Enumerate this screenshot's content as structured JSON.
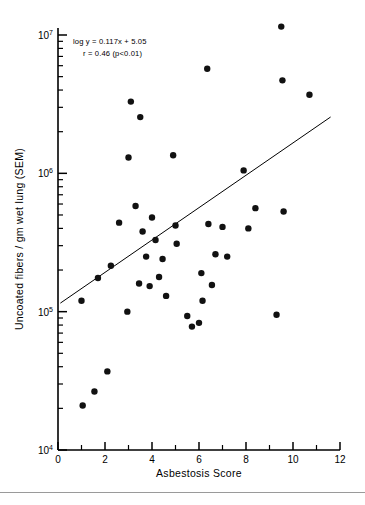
{
  "figure": {
    "title": "",
    "annotation_line1": "log y = 0.117x + 5.05",
    "annotation_line2": "r = 0.46 (p<0.01)",
    "point_color": "#111111",
    "line_color": "#000000",
    "axis_color": "#000000",
    "background": "#ffffff"
  },
  "chart_data": {
    "type": "scatter",
    "title": "",
    "xlabel": "Asbestosis Score",
    "ylabel": "Uncoated fibers / gm wet lung (SEM)",
    "xlim": [
      0,
      12
    ],
    "ylim": [
      10000,
      10000000
    ],
    "yscale": "log",
    "xscale": "linear",
    "grid": false,
    "legend": null,
    "xticks": [
      0,
      2,
      4,
      6,
      8,
      10,
      12
    ],
    "xtick_labels": [
      "0",
      "2",
      "4",
      "6",
      "8",
      "10",
      "12"
    ],
    "xticks_minor": [
      1,
      3,
      5,
      7,
      9,
      11
    ],
    "yticks": [
      10000,
      100000,
      1000000,
      10000000
    ],
    "ytick_labels": [
      "10⁴",
      "10⁵",
      "10⁶",
      "10⁷"
    ],
    "ytick_mantissa": [
      "10",
      "10",
      "10",
      "10"
    ],
    "ytick_exponent": [
      "4",
      "5",
      "6",
      "7"
    ],
    "annotations": [
      {
        "text": "log y = 0.117x + 5.05",
        "x": 1.2,
        "y": 4500000
      },
      {
        "text": "r = 0.46 (p<0.01)",
        "x": 1.9,
        "y": 3200000
      }
    ],
    "fit": {
      "type": "linear-log",
      "equation": "log y = 0.117x + 5.05",
      "slope": 0.117,
      "intercept": 5.05,
      "r": 0.46,
      "p_text": "p<0.01",
      "x_start": 0.1,
      "x_end": 11.6
    },
    "points": [
      {
        "x": 1.05,
        "y": 21000
      },
      {
        "x": 1.55,
        "y": 26500
      },
      {
        "x": 2.1,
        "y": 37000
      },
      {
        "x": 1.0,
        "y": 120000
      },
      {
        "x": 1.7,
        "y": 175000
      },
      {
        "x": 2.25,
        "y": 215000
      },
      {
        "x": 2.6,
        "y": 440000
      },
      {
        "x": 2.95,
        "y": 100000
      },
      {
        "x": 3.0,
        "y": 1300000
      },
      {
        "x": 3.1,
        "y": 3300000
      },
      {
        "x": 3.3,
        "y": 580000
      },
      {
        "x": 3.45,
        "y": 160000
      },
      {
        "x": 3.5,
        "y": 2550000
      },
      {
        "x": 3.6,
        "y": 380000
      },
      {
        "x": 3.75,
        "y": 250000
      },
      {
        "x": 3.9,
        "y": 153000
      },
      {
        "x": 4.0,
        "y": 480000
      },
      {
        "x": 4.15,
        "y": 330000
      },
      {
        "x": 4.3,
        "y": 178000
      },
      {
        "x": 4.45,
        "y": 240000
      },
      {
        "x": 4.6,
        "y": 130000
      },
      {
        "x": 4.9,
        "y": 1350000
      },
      {
        "x": 5.0,
        "y": 420000
      },
      {
        "x": 5.05,
        "y": 310000
      },
      {
        "x": 5.5,
        "y": 93000
      },
      {
        "x": 5.7,
        "y": 78000
      },
      {
        "x": 6.0,
        "y": 83000
      },
      {
        "x": 6.1,
        "y": 190000
      },
      {
        "x": 6.15,
        "y": 120000
      },
      {
        "x": 6.35,
        "y": 5700000
      },
      {
        "x": 6.4,
        "y": 430000
      },
      {
        "x": 6.55,
        "y": 156000
      },
      {
        "x": 6.7,
        "y": 260000
      },
      {
        "x": 7.0,
        "y": 410000
      },
      {
        "x": 7.2,
        "y": 250000
      },
      {
        "x": 7.9,
        "y": 1050000
      },
      {
        "x": 8.1,
        "y": 400000
      },
      {
        "x": 8.4,
        "y": 560000
      },
      {
        "x": 9.3,
        "y": 95000
      },
      {
        "x": 9.5,
        "y": 11500000
      },
      {
        "x": 9.55,
        "y": 4700000
      },
      {
        "x": 9.6,
        "y": 530000
      },
      {
        "x": 10.7,
        "y": 3700000
      }
    ]
  }
}
